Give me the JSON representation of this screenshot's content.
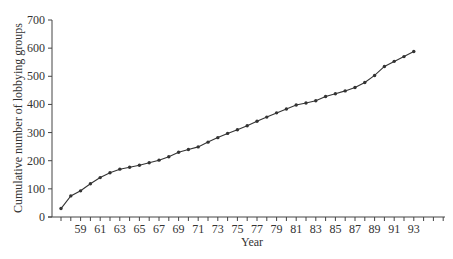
{
  "chart_data": {
    "type": "line",
    "title": "",
    "xlabel": "Year",
    "ylabel": "Cumulative number of lobbying groups",
    "ylim": [
      0,
      700
    ],
    "yticks": [
      0,
      100,
      200,
      300,
      400,
      500,
      600,
      700
    ],
    "xtick_labels": [
      "59",
      "61",
      "63",
      "65",
      "67",
      "69",
      "71",
      "73",
      "75",
      "77",
      "79",
      "81",
      "83",
      "85",
      "87",
      "89",
      "91",
      "93"
    ],
    "grid": false,
    "legend": null,
    "series": [
      {
        "name": "Cumulative lobbying groups",
        "color": "#333333",
        "x": [
          1957,
          1958,
          1959,
          1960,
          1961,
          1962,
          1963,
          1964,
          1965,
          1966,
          1967,
          1968,
          1969,
          1970,
          1971,
          1972,
          1973,
          1974,
          1975,
          1976,
          1977,
          1978,
          1979,
          1980,
          1981,
          1982,
          1983,
          1984,
          1985,
          1986,
          1987,
          1988,
          1989,
          1990,
          1991,
          1992,
          1993
        ],
        "values": [
          30,
          75,
          93,
          118,
          140,
          157,
          170,
          177,
          184,
          193,
          202,
          214,
          230,
          240,
          249,
          266,
          282,
          297,
          310,
          324,
          340,
          355,
          370,
          384,
          398,
          405,
          413,
          428,
          438,
          448,
          460,
          478,
          503,
          535,
          553,
          570,
          588
        ]
      }
    ]
  }
}
